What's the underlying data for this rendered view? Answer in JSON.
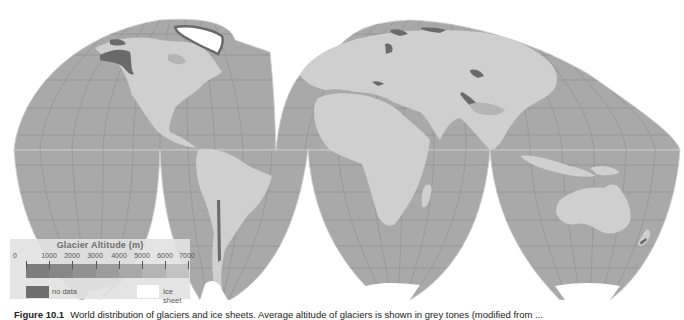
{
  "figure": {
    "caption_label": "Figure 10.1",
    "caption_text": "World distribution of glaciers and ice sheets. Average altitude of glaciers is shown in grey tones (modified from ..."
  },
  "map": {
    "projection": "interrupted homolosine",
    "colors": {
      "ocean": "#a9a9a9",
      "land": "#cfcfcf",
      "graticule": "#8f8f8f",
      "glacier_dark": "#6a6a6a",
      "ice_sheet": "#ffffff",
      "background": "#ffffff"
    }
  },
  "legend": {
    "title": "Glacier Altitude (m)",
    "ticks": [
      "0",
      "1000",
      "2000",
      "3000",
      "4000",
      "5000",
      "6000",
      "7000"
    ],
    "gradient_colors": [
      "#7d7d7d",
      "#878787",
      "#919191",
      "#9c9c9c",
      "#a8a8a8",
      "#b4b4b4",
      "#c2c2c2"
    ],
    "no_data_label": "no data",
    "ice_sheet_label": "Ice sheet"
  }
}
